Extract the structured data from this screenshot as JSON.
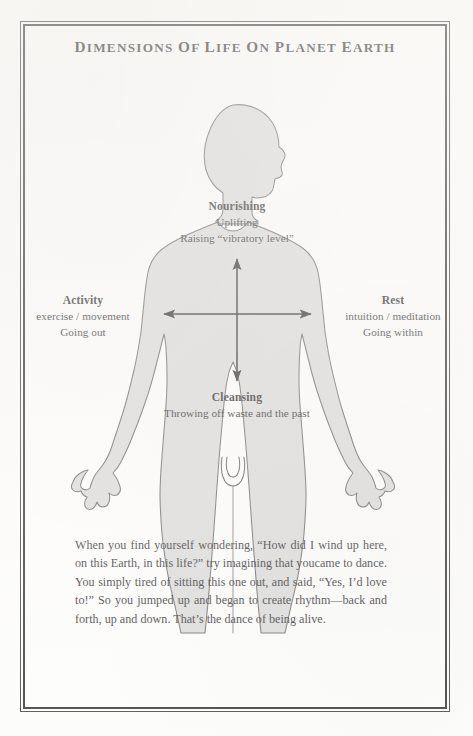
{
  "page": {
    "title_words": [
      "D",
      "IMENSIONS",
      " OF ",
      "L",
      "IFE ",
      "ON ",
      "P",
      "LANET ",
      "E",
      "ARTH"
    ],
    "title": "DIMENSIONS OF LIFE ON PLANET EARTH",
    "background_color": "#fdfdfc",
    "frame_color": "#1c1c1c",
    "figure_fill": "#d9d9d9",
    "figure_stroke": "#4a4a4a",
    "arrow_color": "#1a1a1a",
    "footer_remnant": ""
  },
  "diagram": {
    "figure_name": "human-body-silhouette",
    "axes": {
      "vertical": {
        "name": "vertical-axis-arrow",
        "top_label_group": "nourishing",
        "bottom_label_group": "cleansing",
        "double_headed": true
      },
      "horizontal": {
        "name": "horizontal-axis-arrow",
        "left_label_group": "activity",
        "right_label_group": "rest",
        "double_headed": true
      }
    },
    "labels": {
      "nourishing": {
        "heading": "Nourishing",
        "lines": [
          "Uplifting",
          "Raising “vibratory level”"
        ]
      },
      "activity": {
        "heading": "Activity",
        "lines": [
          "exercise / movement",
          "Going out"
        ]
      },
      "rest": {
        "heading": "Rest",
        "lines": [
          "intuition / meditation",
          "Going within"
        ]
      },
      "cleansing": {
        "heading": "Cleansing",
        "lines": [
          "Throwing off waste and the past"
        ]
      }
    }
  },
  "body": {
    "paragraph": "When you find yourself wondering, “How did I wind up here, on this Earth, in this life?” try imagining that youcame to dance. You simply tired of sitting this one out, and said, “Yes, I’d love to!” So you jumped up and began to create rhythm—back and forth, up and down. That’s the dance of being alive."
  }
}
